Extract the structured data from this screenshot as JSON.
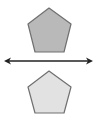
{
  "diagram": {
    "type": "reflection",
    "shapes": [
      {
        "name": "pre-image-pentagon",
        "points": "49,8 71,24 64,52 35,52 28,24",
        "fill": "#b9b9b9",
        "stroke": "#707070"
      },
      {
        "name": "image-pentagon",
        "points": "49,71 71,87 64,113 35,113 28,87",
        "fill": "#e2e2e2",
        "stroke": "#707070"
      }
    ],
    "line": {
      "name": "line-of-reflection",
      "x1": 4,
      "y1": 61,
      "x2": 93,
      "y2": 61,
      "stroke": "#222222",
      "arrows": "both"
    }
  }
}
